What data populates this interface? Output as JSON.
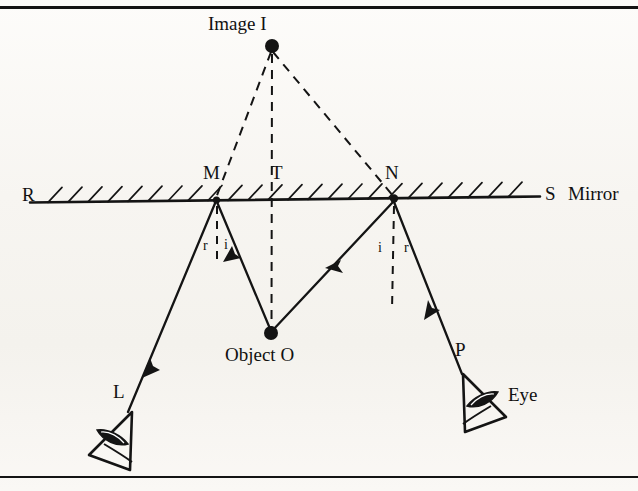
{
  "figure": {
    "type": "optics-ray-diagram",
    "border": {
      "top": true,
      "bottom": true,
      "color": "#141414"
    }
  },
  "labels": {
    "image": "Image I",
    "object": "Object O",
    "mirror_left_end": "R",
    "mirror_right_end": "S",
    "mirror_name": "Mirror",
    "point_m": "M",
    "point_t": "T",
    "point_n": "N",
    "point_l": "L",
    "point_p": "P",
    "eye_left": "",
    "eye_right": "Eye"
  },
  "angles": {
    "m_left": "r",
    "m_right": "i",
    "n_left": "i",
    "n_right": "r"
  },
  "geometry": {
    "image_point": {
      "x": 272,
      "y": 46
    },
    "object_point": {
      "x": 271,
      "y": 333
    },
    "mirror_line": {
      "x1": 30,
      "y1": 202,
      "x2": 540,
      "y2": 196
    },
    "point_m": {
      "x": 216,
      "y": 199
    },
    "point_t": {
      "x": 272,
      "y": 198
    },
    "point_n": {
      "x": 394,
      "y": 197
    },
    "eye_left_tip": {
      "x": 133,
      "y": 410
    },
    "eye_right_tip": {
      "x": 452,
      "y": 368
    },
    "ray_om_start": {
      "x": 271,
      "y": 333
    },
    "ray_ml_end": {
      "x": 128,
      "y": 412
    },
    "ray_on_start": {
      "x": 271,
      "y": 333
    },
    "ray_np_end": {
      "x": 462,
      "y": 374
    }
  },
  "style": {
    "ink": "#141414",
    "dash_pattern": "9 7",
    "solid_width": 2.2,
    "dash_width": 2.0
  },
  "ghost_text": {
    "line1": "",
    "line2": "",
    "line3": "",
    "line4": "",
    "line5": "",
    "line6": ""
  }
}
